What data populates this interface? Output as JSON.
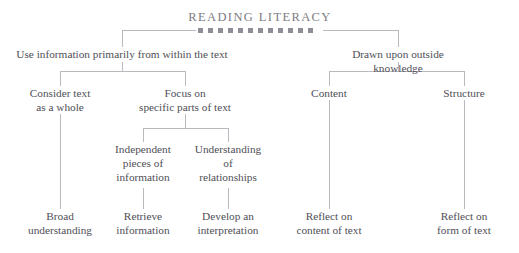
{
  "title": "READING LITERACY",
  "decoration": {
    "square_count": 12,
    "square_color": "#8e8e96"
  },
  "colors": {
    "text": "#4f4f57",
    "title": "#7c7c84",
    "line": "#b9b9c0",
    "background": "#ffffff"
  },
  "chart_data": {
    "type": "tree-diagram",
    "root": "READING LITERACY",
    "levels": 4
  },
  "nodes": {
    "level1": [
      {
        "id": "within-text",
        "label": "Use information primarily from within the text"
      },
      {
        "id": "outside-knowledge",
        "label": "Drawn upon outside knowledge"
      }
    ],
    "level2": [
      {
        "id": "consider-whole",
        "label": "Consider text\nas a whole"
      },
      {
        "id": "focus-specific",
        "label": "Focus on\nspecific parts of text"
      },
      {
        "id": "content",
        "label": "Content"
      },
      {
        "id": "structure",
        "label": "Structure"
      }
    ],
    "level3": [
      {
        "id": "independent-pieces",
        "label": "Independent\npieces of\ninformation"
      },
      {
        "id": "understanding-relationships",
        "label": "Understanding\nof\nrelationships"
      }
    ],
    "level4": [
      {
        "id": "broad-understanding",
        "label": "Broad\nunderstanding"
      },
      {
        "id": "retrieve-information",
        "label": "Retrieve\ninformation"
      },
      {
        "id": "develop-interpretation",
        "label": "Develop an\ninterpretation"
      },
      {
        "id": "reflect-content",
        "label": "Reflect on\ncontent of text"
      },
      {
        "id": "reflect-form",
        "label": "Reflect on\nform of text"
      }
    ]
  }
}
